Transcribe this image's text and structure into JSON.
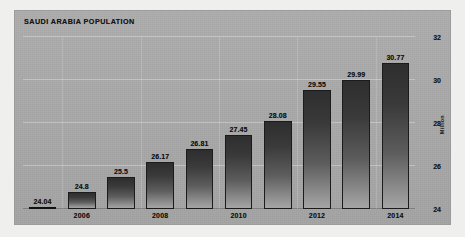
{
  "chart_data": {
    "type": "bar",
    "title": "SAUDI ARABIA POPULATION",
    "xlabel": "",
    "ylabel": "Million",
    "categories": [
      "2005",
      "2006",
      "2007",
      "2008",
      "2009",
      "2010",
      "2011",
      "2012",
      "2013",
      "2014"
    ],
    "visible_tick_labels": [
      "",
      "2006",
      "",
      "2008",
      "",
      "2010",
      "",
      "2012",
      "",
      "2014"
    ],
    "values": [
      24.04,
      24.8,
      25.5,
      26.17,
      26.81,
      27.45,
      28.08,
      29.55,
      29.99,
      30.77
    ],
    "value_labels": [
      "24.04",
      "24.8",
      "25.5",
      "26.17",
      "26.81",
      "27.45",
      "28.08",
      "29.55",
      "29.99",
      "30.77"
    ],
    "ylim": [
      24,
      32
    ],
    "yticks": [
      24,
      26,
      28,
      30,
      32
    ],
    "ytick_labels": [
      "24",
      "26",
      "28",
      "30",
      "32"
    ],
    "grid": true,
    "legend": "none",
    "y_axis_position": "right",
    "colors": {
      "panel_background": "#a8a8a8",
      "page_background": "#efefed",
      "bar_top": "#2e2e2e",
      "bar_bottom": "#a5a5a5",
      "bar_outline": "#1b1b1b",
      "text": "#141414",
      "gridline": "#ffffff"
    }
  }
}
